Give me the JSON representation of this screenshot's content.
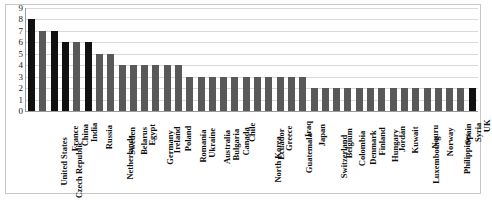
{
  "chart_data": {
    "type": "bar",
    "title": "",
    "subtitle": "",
    "xlabel": "",
    "ylabel": "",
    "ylim": [
      0,
      9
    ],
    "yticks": [
      0,
      1,
      2,
      3,
      4,
      5,
      6,
      7,
      8,
      9
    ],
    "ytick_labels": [
      "0",
      "1",
      "2",
      "3",
      "4",
      "5",
      "6",
      "7",
      "8",
      "9"
    ],
    "grid": true,
    "legend": false,
    "bar_color": "#595959",
    "highlight_color": "#111111",
    "categories": [
      "United States",
      "Czech Republic",
      "France",
      "China",
      "India",
      "Russia",
      "Netherlands",
      "Sweden",
      "Belarus",
      "Egypt",
      "Germany",
      "Ireland",
      "Poland",
      "Romania",
      "Ukraine",
      "Australia",
      "Bulgaria",
      "Canada",
      "Chile",
      "North Korea",
      "Ecuador",
      "Greece",
      "Guatemala",
      "Iraq",
      "Japan",
      "Switzerland",
      "Belgium",
      "Colombia",
      "Denmark",
      "Finland",
      "Hungary",
      "Jordan",
      "Kuwait",
      "Luxembourg",
      "Nauru",
      "Norway",
      "Philippines",
      "Spain",
      "Syria",
      "UK"
    ],
    "values": [
      8,
      7,
      7,
      6,
      6,
      6,
      5,
      5,
      4,
      4,
      4,
      4,
      4,
      4,
      3,
      3,
      3,
      3,
      3,
      3,
      3,
      3,
      3,
      3,
      3,
      2,
      2,
      2,
      2,
      2,
      2,
      2,
      2,
      2,
      2,
      2,
      2,
      2,
      2,
      2
    ],
    "highlighted": [
      true,
      false,
      true,
      true,
      false,
      true,
      false,
      false,
      false,
      false,
      false,
      false,
      false,
      false,
      false,
      false,
      false,
      false,
      false,
      false,
      false,
      false,
      false,
      false,
      false,
      false,
      false,
      false,
      false,
      false,
      false,
      false,
      false,
      false,
      false,
      false,
      false,
      false,
      false,
      true
    ]
  }
}
